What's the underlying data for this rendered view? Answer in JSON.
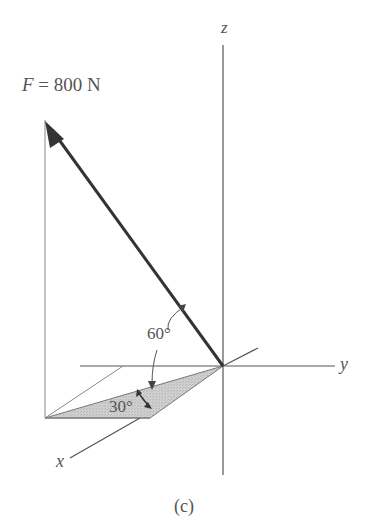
{
  "figure": {
    "caption": "(c)",
    "force": {
      "symbol": "F",
      "equals": " = ",
      "magnitude": "800 N",
      "color": "#333333"
    },
    "axes": {
      "x": "x",
      "y": "y",
      "z": "z"
    },
    "angles": {
      "elevation": "60°",
      "azimuth": "30°"
    },
    "colors": {
      "axis_line": "#555555",
      "construction_line": "#888888",
      "shaded_plane": "#c8c8c8",
      "text": "#555555"
    }
  }
}
